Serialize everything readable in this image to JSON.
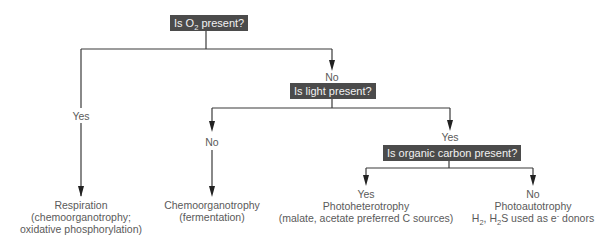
{
  "questions": {
    "q1": {
      "pre": "Is O",
      "sub": "2",
      "post": " present?"
    },
    "q2": {
      "text": "Is light present?"
    },
    "q3": {
      "text": "Is organic carbon present?"
    }
  },
  "branches": {
    "q1_yes": "Yes",
    "q1_no": "No",
    "q2_no": "No",
    "q2_yes": "Yes",
    "q3_yes": "Yes",
    "q3_no": "No"
  },
  "outcomes": {
    "respiration": {
      "line1": "Respiration",
      "line2": "(chemoorganotrophy;",
      "line3": "oxidative phosphorylation)"
    },
    "fermentation": {
      "line1": "Chemoorganotrophy",
      "line2": "(fermentation)"
    },
    "photoheterotrophy": {
      "line1": "Photoheterotrophy",
      "line2": "(malate, acetate preferred C sources)"
    },
    "photoautotrophy": {
      "line1": "Photoautotrophy",
      "l2a": "H",
      "l2b": "2",
      "l2c": ", H",
      "l2d": "2",
      "l2e": "S used as e",
      "l2f": "-",
      "l2g": " donors"
    }
  },
  "colors": {
    "box": "#4b4b4b",
    "line": "#3a3a3a",
    "text": "#5a5a5a"
  }
}
